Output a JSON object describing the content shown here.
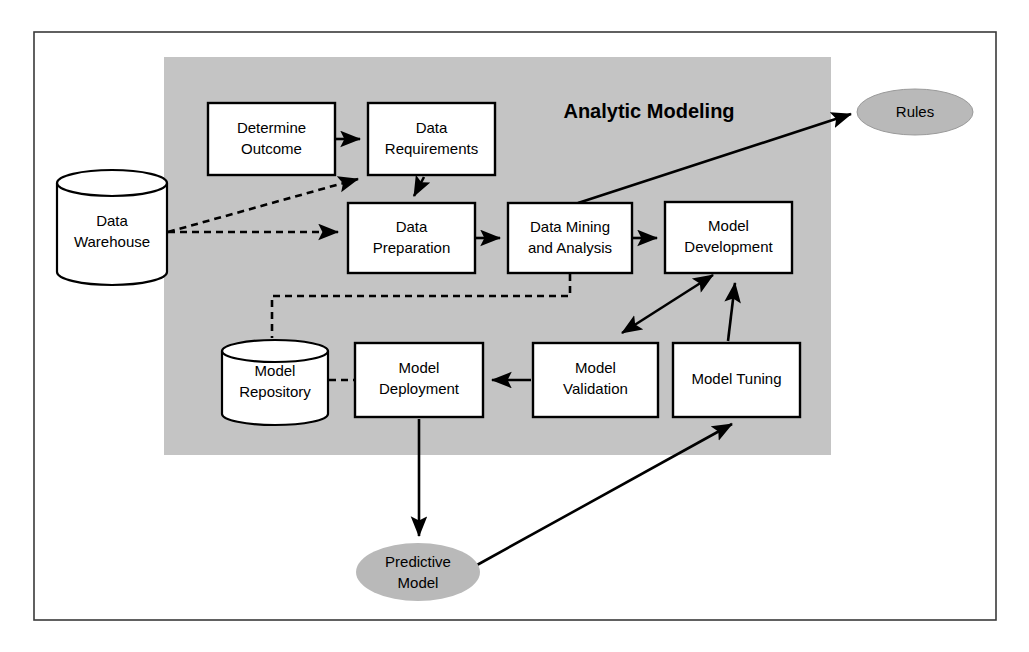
{
  "diagram": {
    "title": "Analytic Modeling",
    "panel": {
      "fill": "#c4c4c4",
      "x": 164,
      "y": 57,
      "w": 667,
      "h": 398
    },
    "frame": {
      "stroke": "#3a3a3a",
      "x": 34,
      "y": 32,
      "w": 962,
      "h": 588
    },
    "colors": {
      "panel_gray": "#c4c4c4",
      "ellipse_gray": "#b9b9b9",
      "box_fill": "#ffffff",
      "line": "#000000",
      "frame": "#3a3a3a"
    },
    "process_boxes": [
      {
        "id": "determine-outcome",
        "label_line1": "Determine",
        "label_line2": "Outcome",
        "x": 208,
        "y": 103,
        "w": 127,
        "h": 72
      },
      {
        "id": "data-requirements",
        "label_line1": "Data",
        "label_line2": "Requirements",
        "x": 368,
        "y": 103,
        "w": 127,
        "h": 72
      },
      {
        "id": "data-preparation",
        "label_line1": "Data",
        "label_line2": "Preparation",
        "x": 348,
        "y": 203,
        "w": 127,
        "h": 70
      },
      {
        "id": "data-mining-and-analysis",
        "label_line1": "Data Mining",
        "label_line2": "and Analysis",
        "x": 508,
        "y": 203,
        "w": 124,
        "h": 70
      },
      {
        "id": "model-development",
        "label_line1": "Model",
        "label_line2": "Development",
        "x": 665,
        "y": 202,
        "w": 127,
        "h": 71
      },
      {
        "id": "model-deployment",
        "label_line1": "Model",
        "label_line2": "Deployment",
        "x": 355,
        "y": 343,
        "w": 128,
        "h": 74
      },
      {
        "id": "model-validation",
        "label_line1": "Model",
        "label_line2": "Validation",
        "x": 533,
        "y": 343,
        "w": 125,
        "h": 74
      },
      {
        "id": "model-tuning",
        "label_line1": "Model Tuning",
        "label_line2": "",
        "x": 673,
        "y": 343,
        "w": 127,
        "h": 74
      }
    ],
    "cylinders": [
      {
        "id": "data-warehouse",
        "label_line1": "Data",
        "label_line2": "Warehouse",
        "x": 57,
        "y": 170,
        "w": 110,
        "h": 115
      },
      {
        "id": "model-repository",
        "label_line1": "Model",
        "label_line2": "Repository",
        "x": 222,
        "y": 340,
        "w": 106,
        "h": 85
      }
    ],
    "ellipses": [
      {
        "id": "rules",
        "label_line1": "Rules",
        "label_line2": "",
        "cx": 915,
        "cy": 112,
        "rx": 58,
        "ry": 23,
        "bordered": true
      },
      {
        "id": "predictive-model",
        "label_line1": "Predictive",
        "label_line2": "Model",
        "cx": 418,
        "cy": 572,
        "rx": 62,
        "ry": 29,
        "bordered": false
      }
    ],
    "connections": [
      {
        "id": "determine-outcome-to-data-requirements",
        "style": "solid"
      },
      {
        "id": "data-requirements-to-data-preparation",
        "style": "solid"
      },
      {
        "id": "data-preparation-to-data-mining",
        "style": "solid"
      },
      {
        "id": "data-mining-to-model-development",
        "style": "solid"
      },
      {
        "id": "data-mining-to-rules",
        "style": "solid"
      },
      {
        "id": "data-warehouse-to-data-requirements",
        "style": "dashed"
      },
      {
        "id": "data-warehouse-to-data-preparation",
        "style": "dashed"
      },
      {
        "id": "data-mining-to-model-repository",
        "style": "dashed"
      },
      {
        "id": "model-repository-to-model-deployment",
        "style": "dashed"
      },
      {
        "id": "model-development-to-model-validation",
        "style": "solid-bidirectional"
      },
      {
        "id": "model-validation-to-model-deployment",
        "style": "solid"
      },
      {
        "id": "model-tuning-to-model-development",
        "style": "solid"
      },
      {
        "id": "model-deployment-to-predictive-model",
        "style": "solid"
      },
      {
        "id": "predictive-model-to-model-tuning",
        "style": "solid"
      }
    ]
  }
}
